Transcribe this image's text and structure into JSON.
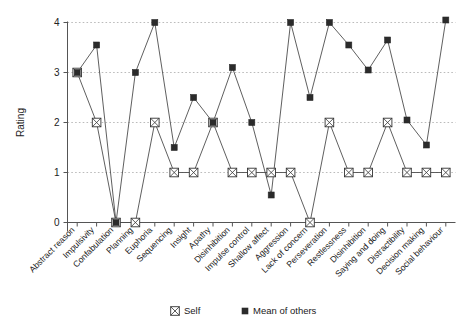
{
  "chart_data": {
    "type": "line",
    "title": "",
    "xlabel": "",
    "ylabel": "Rating",
    "ylim": [
      0,
      4
    ],
    "yticks": [
      0,
      1,
      2,
      3,
      4
    ],
    "grid": true,
    "legend_position": "bottom",
    "categories": [
      "Abstract reason",
      "Impulsivity",
      "Confabulation",
      "Planning",
      "Euphoria",
      "Sequencing",
      "Insight",
      "Apathy",
      "Disinhibition",
      "Impulse control",
      "Shallow affect",
      "Aggression",
      "Lack of concern",
      "Perseveration",
      "Restlessness",
      "Disinhibition",
      "Saying and doing",
      "Distractibility",
      "Decision making",
      "Social behaviour"
    ],
    "series": [
      {
        "name": "Self",
        "marker": "crossed-square",
        "values": [
          3,
          2,
          0,
          0,
          2,
          1,
          1,
          2,
          1,
          1,
          1,
          1,
          0,
          2,
          1,
          1,
          2,
          1,
          1,
          1
        ]
      },
      {
        "name": "Mean of others",
        "marker": "filled-square",
        "values": [
          3,
          3.55,
          0,
          3,
          4,
          1.5,
          2.5,
          2,
          3.1,
          2,
          0.55,
          4,
          2.5,
          4,
          3.55,
          3.05,
          3.65,
          2.05,
          1.55,
          4.05
        ]
      }
    ]
  },
  "legend": {
    "items": [
      {
        "label": "Self",
        "marker": "crossed-square"
      },
      {
        "label": "Mean of others",
        "marker": "filled-square"
      }
    ]
  },
  "colors": {
    "line": "#4d4d4d",
    "marker_fill": "#2b2b2b",
    "axis": "#555555",
    "grid": "#aaaaaa",
    "background": "#ffffff"
  }
}
